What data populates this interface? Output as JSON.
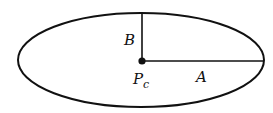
{
  "diagram": {
    "type": "ellipse",
    "labels": {
      "semi_minor": "B",
      "semi_major": "A",
      "center_main": "P",
      "center_sub": "c"
    },
    "colors": {
      "stroke": "#111111",
      "background": "#ffffff"
    }
  }
}
